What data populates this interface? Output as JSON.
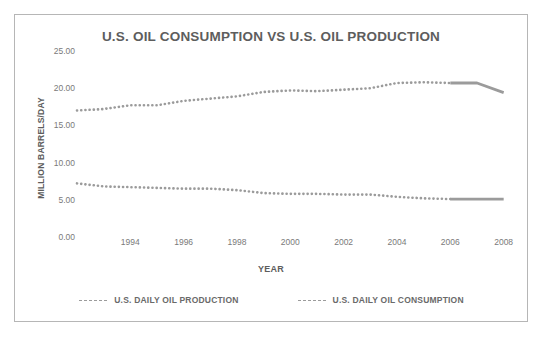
{
  "chart_data": {
    "type": "line",
    "title": "U.S. OIL CONSUMPTION VS U.S. OIL PRODUCTION",
    "xlabel": "YEAR",
    "ylabel": "MILLION BARRELS/DAY",
    "xlim": [
      1992,
      2008.5
    ],
    "ylim": [
      0.0,
      25.0
    ],
    "grid": false,
    "legend_position": "bottom-center",
    "line_style": "dotted",
    "series_color": "#9b9b9b",
    "x": [
      1992,
      1993,
      1994,
      1995,
      1996,
      1997,
      1998,
      1999,
      2000,
      2001,
      2002,
      2003,
      2004,
      2005,
      2006,
      2007,
      2008
    ],
    "series": [
      {
        "name": "U.S. DAILY OIL CONSUMPTION",
        "values": [
          17.0,
          17.2,
          17.7,
          17.7,
          18.3,
          18.6,
          18.9,
          19.5,
          19.7,
          19.6,
          19.8,
          20.0,
          20.7,
          20.8,
          20.7,
          20.7,
          19.4
        ]
      },
      {
        "name": "U.S. DAILY OIL PRODUCTION",
        "values": [
          7.2,
          6.8,
          6.7,
          6.6,
          6.5,
          6.5,
          6.3,
          5.9,
          5.8,
          5.8,
          5.7,
          5.7,
          5.4,
          5.2,
          5.1,
          5.1,
          5.1
        ]
      }
    ],
    "y_ticks": [
      "0.00",
      "5.00",
      "10.00",
      "15.00",
      "20.00",
      "25.00"
    ],
    "y_tick_values": [
      0,
      5,
      10,
      15,
      20,
      25
    ],
    "x_ticks": [
      "1994",
      "1996",
      "1998",
      "2000",
      "2002",
      "2004",
      "2006",
      "2008"
    ],
    "x_tick_values": [
      1994,
      1996,
      1998,
      2000,
      2002,
      2004,
      2006,
      2008
    ],
    "legend": [
      {
        "label": "U.S. DAILY OIL PRODUCTION",
        "color": "#9b9b9b"
      },
      {
        "label": "U.S. DAILY OIL CONSUMPTION",
        "color": "#9b9b9b"
      }
    ]
  }
}
